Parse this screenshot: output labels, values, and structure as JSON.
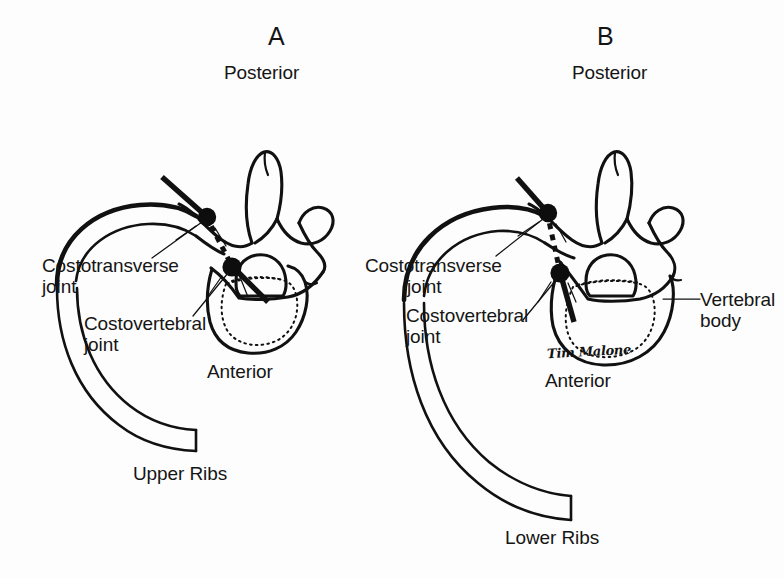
{
  "figure": {
    "kind": "anatomical-line-drawing",
    "background_color": "#fdfdfd",
    "ink_color": "#111111",
    "signature": "Tim Malone"
  },
  "panels": [
    {
      "id": "A",
      "letter": "A",
      "top_orientation": "Posterior",
      "bottom_orientation": "Anterior",
      "caption": "Upper Ribs",
      "labels": [
        {
          "key": "costotransverse",
          "line1": "Costotransverse",
          "line2": "joint"
        },
        {
          "key": "costovertebral",
          "line1": "Costovertebral",
          "line2": "joint"
        }
      ],
      "joint_markers": [
        "costotransverse-joint",
        "costovertebral-joint"
      ]
    },
    {
      "id": "B",
      "letter": "B",
      "top_orientation": "Posterior",
      "bottom_orientation": "Anterior",
      "caption": "Lower Ribs",
      "labels": [
        {
          "key": "costotransverse",
          "line1": "Costotransverse",
          "line2": "joint"
        },
        {
          "key": "costovertebral",
          "line1": "Costovertebral",
          "line2": "joint"
        },
        {
          "key": "vertebral-body",
          "line1": "Vertebral",
          "line2": "body"
        }
      ],
      "joint_markers": [
        "costotransverse-joint",
        "costovertebral-joint"
      ]
    }
  ],
  "structures": {
    "spinous_process": "spinous process",
    "transverse_process": "transverse process",
    "vertebral_foramen": "vertebral foramen",
    "vertebral_body": "vertebral body",
    "rib": "rib",
    "needle_trajectory": "needle trajectory"
  }
}
